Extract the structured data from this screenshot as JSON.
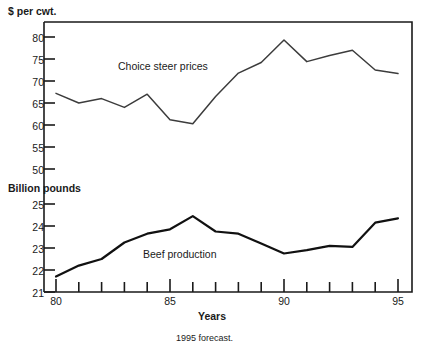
{
  "chart_data": {
    "type": "line",
    "title": "",
    "footnote": "1995 forecast.",
    "xlabel": "Years",
    "x": [
      80,
      81,
      82,
      83,
      84,
      85,
      86,
      87,
      88,
      89,
      90,
      91,
      92,
      93,
      94,
      95
    ],
    "xticklabels": [
      "80",
      "",
      "",
      "",
      "",
      "85",
      "",
      "",
      "",
      "",
      "90",
      "",
      "",
      "",
      "",
      "95"
    ],
    "xlim": [
      80,
      95
    ],
    "panels": [
      {
        "name": "choice-steer-prices",
        "label": "Choice steer prices",
        "ylabel": "$ per cwt.",
        "ylim": [
          50,
          80
        ],
        "yticks": [
          50,
          55,
          60,
          65,
          70,
          75,
          80
        ],
        "yticklabels": [
          "50",
          "55",
          "60",
          "65",
          "70",
          "75",
          "80"
        ],
        "values": [
          67.2,
          65.0,
          66.0,
          64.0,
          67.0,
          61.2,
          60.3,
          66.5,
          71.8,
          74.2,
          79.3,
          74.4,
          75.8,
          77.0,
          72.5,
          71.7
        ]
      },
      {
        "name": "beef-production",
        "label": "Beef production",
        "ylabel": "Billion pounds",
        "ylim": [
          21,
          25
        ],
        "yticks": [
          21,
          22,
          23,
          24,
          25
        ],
        "yticklabels": [
          "21",
          "22",
          "23",
          "24",
          "25"
        ],
        "values": [
          21.7,
          22.2,
          22.5,
          23.25,
          23.65,
          23.85,
          24.45,
          23.75,
          23.65,
          23.2,
          22.75,
          22.9,
          23.1,
          23.05,
          24.15,
          24.35
        ]
      }
    ],
    "grid": false,
    "legend": "inline-annotations",
    "line_color": "#3c3c3c",
    "line_color_secondary": "#111111"
  }
}
